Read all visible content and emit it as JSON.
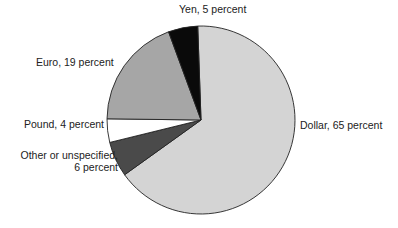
{
  "chart_data": {
    "type": "pie",
    "title": "",
    "categories": [
      "Dollar",
      "Other or unspecified",
      "Pound",
      "Euro",
      "Yen"
    ],
    "values": [
      65,
      6,
      4,
      19,
      5
    ],
    "unit": "percent",
    "start_angle_deg": -2,
    "direction": "clockwise",
    "colors": [
      "#d4d4d4",
      "#4a4a4a",
      "#ffffff",
      "#a6a6a6",
      "#0a0a0a"
    ],
    "center": [
      201,
      120
    ],
    "radius": 94,
    "legend": "none (direct labels)"
  },
  "labels": {
    "dollar": "Dollar, 65 percent",
    "other_line1": "Other or unspecified,",
    "other_line2": "6 percent",
    "pound": "Pound, 4 percent",
    "euro": "Euro, 19 percent",
    "yen": "Yen, 5 percent"
  }
}
